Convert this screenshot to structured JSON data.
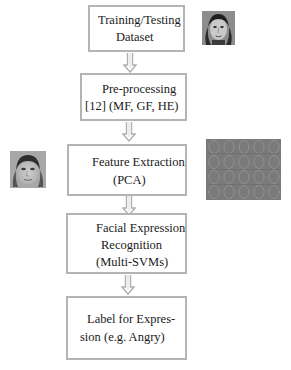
{
  "diagram": {
    "type": "flowchart",
    "direction": "top-to-bottom",
    "colors": {
      "box_border": "#b4b4b4",
      "arrow": "#b0b0b0",
      "text": "#1a1a1a",
      "background": "#ffffff"
    },
    "steps": [
      {
        "id": "dataset",
        "lines": [
          "Training/Testing",
          "Dataset"
        ]
      },
      {
        "id": "preprocessing",
        "lines": [
          "Pre-processing",
          "[12] (MF, GF, HE)"
        ]
      },
      {
        "id": "feature-extraction",
        "lines": [
          "Feature Extraction",
          "(PCA)"
        ]
      },
      {
        "id": "recognition",
        "lines": [
          "Facial Expression",
          "Recognition",
          "(Multi-SVMs)"
        ]
      },
      {
        "id": "label",
        "lines": [
          "Label for Expres-",
          "sion (e.g. Angry)"
        ]
      }
    ],
    "arrows": [
      {
        "from": "dataset",
        "to": "preprocessing"
      },
      {
        "from": "preprocessing",
        "to": "feature-extraction"
      },
      {
        "from": "feature-extraction",
        "to": "recognition"
      },
      {
        "from": "recognition",
        "to": "label"
      }
    ],
    "images": [
      {
        "id": "dataset-face",
        "description": "grayscale face photo",
        "beside": "dataset",
        "side": "right"
      },
      {
        "id": "mean-face",
        "description": "grayscale average face",
        "beside": "feature-extraction",
        "side": "left"
      },
      {
        "id": "eigenfaces",
        "description": "grid of eigenface images",
        "beside": "feature-extraction",
        "side": "right"
      }
    ]
  }
}
